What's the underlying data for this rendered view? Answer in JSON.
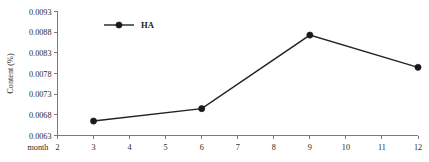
{
  "chart_data": {
    "type": "line",
    "title": "",
    "subtitle": "",
    "xlabel": "month",
    "ylabel": "Content (%)",
    "x": [
      3,
      6,
      9,
      12
    ],
    "xlim": [
      2,
      12
    ],
    "ylim": [
      0.0063,
      0.0093
    ],
    "grid": false,
    "legend_position": "inside-top-left",
    "x_ticks": [
      "2",
      "3",
      "4",
      "5",
      "6",
      "7",
      "8",
      "9",
      "10",
      "11",
      "12"
    ],
    "x_tick_values": [
      2,
      3,
      4,
      5,
      6,
      7,
      8,
      9,
      10,
      11,
      12
    ],
    "y_ticks": [
      "0.0063",
      "0.0068",
      "0.0073",
      "0.0078",
      "0.0083",
      "0.0088",
      "0.0093"
    ],
    "y_tick_values": [
      0.0063,
      0.0068,
      0.0073,
      0.0078,
      0.0083,
      0.0088,
      0.0093
    ],
    "series": [
      {
        "name": "HA",
        "values": [
          0.00665,
          0.00695,
          0.00873,
          0.00795
        ],
        "color": "#191919",
        "marker": "filled-circle",
        "line_style": "solid"
      }
    ]
  },
  "legend": {
    "entries": [
      {
        "label": "HA"
      }
    ]
  },
  "axes": {
    "x_axis_name": "month",
    "y_axis_name": "Content (%)"
  },
  "colors": {
    "line": "#222222",
    "marker": "#191919",
    "axis": "#7a7a78",
    "text": "#2a2a2a",
    "background": "#ffffff"
  }
}
